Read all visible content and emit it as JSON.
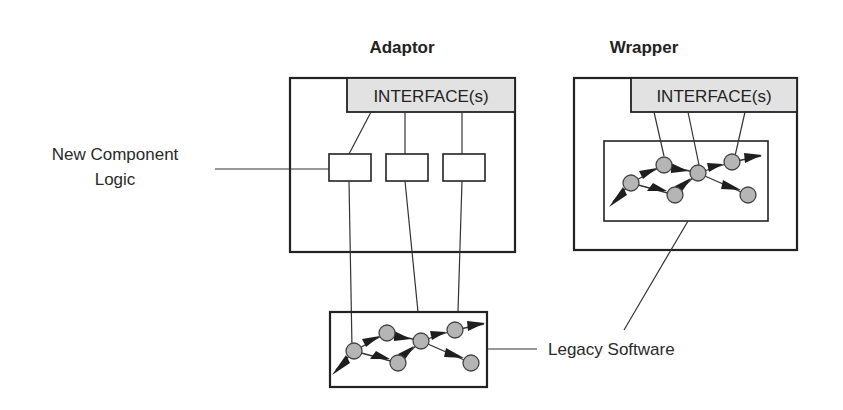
{
  "diagram": {
    "adaptor": {
      "title": "Adaptor",
      "interface_label": "INTERFACE(s)",
      "logic_boxes": 3
    },
    "wrapper": {
      "title": "Wrapper",
      "interface_label": "INTERFACE(s)"
    },
    "labels": {
      "new_component_line1": "New Component",
      "new_component_line2": "Logic",
      "legacy_software": "Legacy Software"
    },
    "colors": {
      "line": "#222222",
      "interface_fill": "#e2e2e2",
      "node_fill": "#b5b5b5",
      "arrow": "#1e1e1e"
    }
  }
}
